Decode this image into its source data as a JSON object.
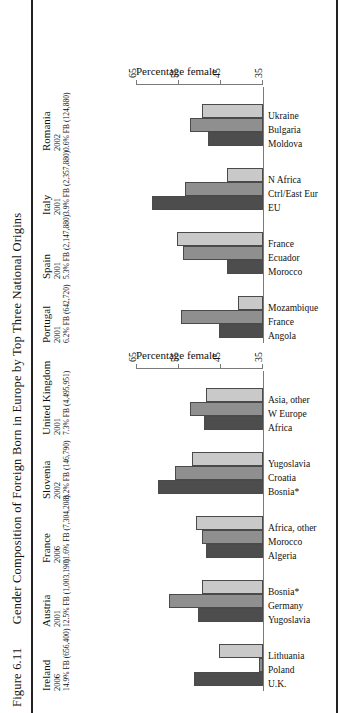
{
  "figure": {
    "number": "Figure 6.11",
    "caption": "Gender Composition of Foreign Born in Europe by Top Three National Origins"
  },
  "axis": {
    "title": "Percentage female",
    "ticks": [
      "35",
      "45",
      "55",
      "65"
    ],
    "min": 35,
    "max": 65
  },
  "colors": {
    "series1": "#4d4d4d",
    "series2": "#8f8f8f",
    "series3": "#c9c9c9",
    "rule": "#222222",
    "axis": "#7a7a7a"
  },
  "chart_data": {
    "type": "bar",
    "title": "Gender Composition of Foreign Born in Europe by Top Three National Origins",
    "xlabel": "",
    "ylabel": "Percentage female",
    "ylim": [
      35,
      65
    ],
    "grid": false,
    "legend": "none",
    "panels": [
      {
        "name": "left",
        "groups": [
          {
            "country": "Ireland",
            "year": "2006",
            "fb": "14.9% FB (656,400)",
            "categories": [
              "U.K.",
              "Poland",
              "Lithuania"
            ],
            "values": [
              51.5,
              36.0,
              45.5
            ]
          },
          {
            "country": "Austria",
            "year": "2001",
            "fb": "12.5% FB (1,003,190)",
            "categories": [
              "Yugoslavia",
              "Germany",
              "Bosnia*"
            ],
            "values": [
              50.5,
              57.5,
              49.5
            ]
          },
          {
            "country": "France",
            "year": "2006",
            "fb": "11.6% FB (7,304,208)",
            "categories": [
              "Algeria",
              "Morocco",
              "Africa, other"
            ],
            "values": [
              48.5,
              49.5,
              51.0
            ]
          },
          {
            "country": "Slovenia",
            "year": "2002",
            "fb": "8.2% FB (146,790)",
            "categories": [
              "Bosnia*",
              "Croatia",
              "Yugoslavia"
            ],
            "values": [
              60.0,
              56.0,
              52.0
            ]
          },
          {
            "country": "United Kingdom",
            "year": "2001",
            "fb": "7.3% FB (4,495,951)",
            "categories": [
              "Africa",
              "W Europe",
              "Asia, other"
            ],
            "values": [
              49.0,
              52.5,
              48.5
            ]
          }
        ]
      },
      {
        "name": "right",
        "groups": [
          {
            "country": "Portugal",
            "year": "2001",
            "fb": "6.2% FB (642,720)",
            "categories": [
              "Angola",
              "France",
              "Mozambique"
            ],
            "values": [
              45.5,
              54.5,
              41.0
            ]
          },
          {
            "country": "Spain",
            "year": "2001",
            "fb": "5.3% FB (2,147,880)",
            "categories": [
              "Morocco",
              "Ecuador",
              "France"
            ],
            "values": [
              43.5,
              54.0,
              55.5
            ]
          },
          {
            "country": "Italy",
            "year": "2001",
            "fb": "3.9% FB (2,357,880)",
            "categories": [
              "EU",
              "Ctrl/East Eur",
              "N Africa"
            ],
            "values": [
              61.5,
              53.5,
              43.5
            ]
          },
          {
            "country": "Romania",
            "year": "2002",
            "fb": "0.6% FB (124,880)",
            "categories": [
              "Moldova",
              "Bulgaria",
              "Ukraine"
            ],
            "values": [
              48.0,
              52.5,
              49.5
            ]
          }
        ]
      }
    ]
  }
}
